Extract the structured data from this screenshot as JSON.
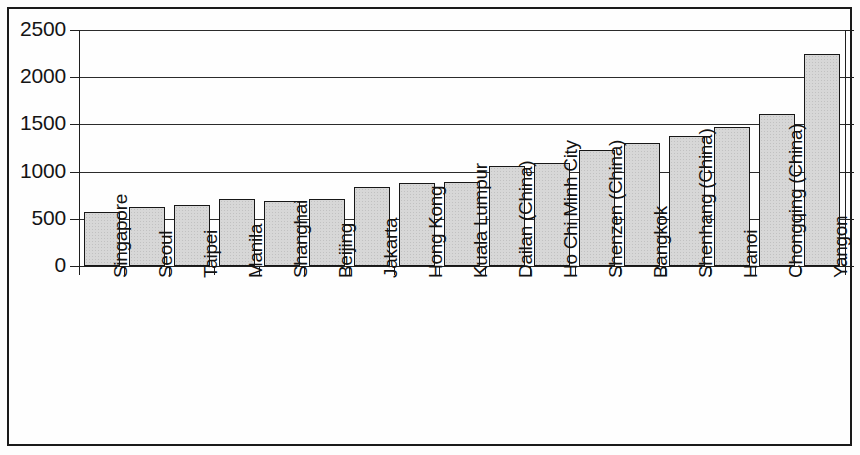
{
  "chart_data": {
    "type": "bar",
    "title": "",
    "subtitle": "",
    "xlabel": "",
    "ylabel": "",
    "ylim": [
      0,
      2500
    ],
    "yticks": [
      0,
      500,
      1000,
      1500,
      2000,
      2500
    ],
    "ytick_labels": [
      "0",
      "500",
      "1000",
      "1500",
      "2000",
      "2500"
    ],
    "grid": true,
    "legend": null,
    "legend_position": "none",
    "bar_fill_color": "#d7d7d7",
    "bar_edge_color": "#171717",
    "categories": [
      "Singapore",
      "Seoul",
      "Taipei",
      "Manila",
      "Shanghai",
      "Beijing",
      "Jakarta",
      "Hong Kong",
      "Kuala Lumpur",
      "Dailan (China)",
      "Ho Chi Minh City",
      "Shenzen (China)",
      "Bangkok",
      "Shenhang (China)",
      "Hanoi",
      "Chongqing (China)",
      "Yangon"
    ],
    "values": [
      570,
      620,
      645,
      715,
      690,
      715,
      840,
      875,
      885,
      1055,
      1095,
      1225,
      1305,
      1375,
      1475,
      1605,
      2250
    ]
  }
}
